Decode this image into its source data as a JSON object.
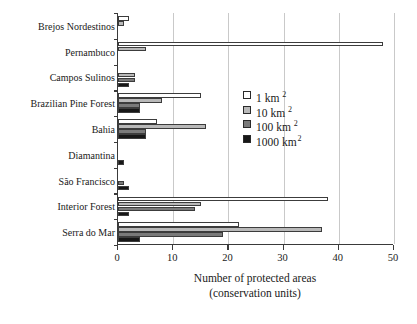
{
  "chart_data": {
    "type": "bar",
    "orientation": "horizontal",
    "title": "",
    "xlabel": "Number of protected areas",
    "xlabel_line2": "(conservation units)",
    "ylabel": "",
    "xlim": [
      0,
      50
    ],
    "xticks": [
      0,
      10,
      20,
      30,
      40,
      50
    ],
    "grid": "vertical",
    "legend_position": "center-right",
    "categories": [
      "Brejos Nordestinos",
      "Pernambuco",
      "Campos Sulinos",
      "Brazilian Pine Forest",
      "Bahia",
      "Diamantina",
      "São Francisco",
      "Interior Forest",
      "Serra do Mar"
    ],
    "series": [
      {
        "name": "1 km",
        "exponent": "2",
        "color": "#ffffff",
        "values": [
          2,
          48,
          0,
          15,
          7,
          0,
          0,
          38,
          22
        ]
      },
      {
        "name": "10 km",
        "exponent": "2",
        "color": "#b9b9b9",
        "values": [
          1,
          5,
          3,
          8,
          16,
          0,
          0,
          15,
          37
        ]
      },
      {
        "name": "100 km",
        "exponent": "2",
        "color": "#7a7a7a",
        "values": [
          0,
          0,
          3,
          4,
          5,
          0,
          1,
          14,
          19
        ]
      },
      {
        "name": "1000 km",
        "exponent": "2",
        "color": "#171717",
        "values": [
          0,
          0,
          2,
          4,
          5,
          1,
          2,
          2,
          4
        ]
      }
    ]
  },
  "legend": {
    "items": [
      {
        "label": "1 km",
        "exponent": "2"
      },
      {
        "label": "10 km",
        "exponent": "2"
      },
      {
        "label": "100 km",
        "exponent": "2"
      },
      {
        "label": "1000 km",
        "exponent": "2"
      }
    ]
  }
}
